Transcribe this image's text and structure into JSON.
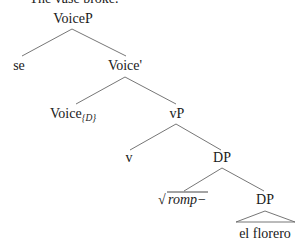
{
  "caption": "The vase broke.",
  "tree": {
    "root": {
      "label": "VoiceP"
    },
    "specifier": {
      "label": "se"
    },
    "voice_bar": {
      "label": "Voice'"
    },
    "voice_head": {
      "label": "Voice",
      "subscript": "{D}"
    },
    "vP": {
      "label": "vP"
    },
    "v_head": {
      "label": "v"
    },
    "DP_upper": {
      "label": "DP"
    },
    "root_node": {
      "radical": "√",
      "label": "romp−"
    },
    "DP_lower": {
      "label": "DP"
    },
    "terminal": {
      "label": "el florero"
    }
  },
  "colors": {
    "text": "#1a1a1a",
    "edge": "#666666",
    "background": "#ffffff"
  }
}
